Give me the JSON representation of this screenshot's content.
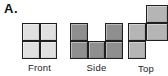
{
  "figure": {
    "marker": "A.",
    "views": [
      {
        "id": "front",
        "label": "Front",
        "fill": "#e0e0e0",
        "grid": [
          [
            1,
            1
          ],
          [
            1,
            1
          ]
        ]
      },
      {
        "id": "side",
        "label": "Side",
        "fill": "#8f8f8f",
        "grid": [
          [
            1,
            0,
            1
          ],
          [
            1,
            1,
            1
          ]
        ]
      },
      {
        "id": "top",
        "label": "Top",
        "fill": "#b5b5b5",
        "grid": [
          [
            0,
            1
          ],
          [
            1,
            1
          ],
          [
            1,
            0
          ]
        ]
      }
    ],
    "colors": {
      "line": "#1f1f1f",
      "background": "#ffffff",
      "label_text": "#1c1c1c"
    }
  }
}
